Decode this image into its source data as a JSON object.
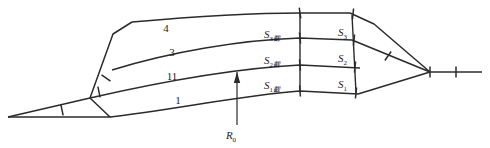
{
  "figure": {
    "type": "line-diagram",
    "background_color": "#ffffff",
    "stroke_color": "#2b2b2b"
  },
  "layer_labels": [
    {
      "id": "layer-4",
      "text": "4",
      "x": 166,
      "y": 32
    },
    {
      "id": "layer-3",
      "text": "3",
      "x": 172,
      "y": 56
    },
    {
      "id": "layer-11",
      "text": "11",
      "x": 172,
      "y": 80
    },
    {
      "id": "layer-1",
      "text": "1",
      "x": 178,
      "y": 104
    }
  ],
  "section_labels": [
    {
      "id": "s3-left",
      "base": "S",
      "sub": "3",
      "sub_extra": "截",
      "x": 264,
      "y": 38
    },
    {
      "id": "s2-left",
      "base": "S",
      "sub": "2",
      "sub_extra": "截",
      "x": 264,
      "y": 64
    },
    {
      "id": "s1-left",
      "base": "S",
      "sub": "1",
      "sub_extra": "截",
      "x": 264,
      "y": 89
    },
    {
      "id": "s3-right",
      "base": "S",
      "sub": "3",
      "sub_extra": "",
      "x": 338,
      "y": 36
    },
    {
      "id": "s2-right",
      "base": "S",
      "sub": "2",
      "sub_extra": "",
      "x": 338,
      "y": 62
    },
    {
      "id": "s1-right",
      "base": "S",
      "sub": "1",
      "sub_extra": "",
      "x": 338,
      "y": 88
    }
  ],
  "annotation": {
    "id": "radius-callout",
    "base": "R",
    "sub": "0",
    "x": 231,
    "y": 139,
    "arrow_from": {
      "x": 237,
      "y": 125
    },
    "arrow_to": {
      "x": 237,
      "y": 72
    }
  },
  "geometry": {
    "curves": [
      {
        "name": "boundary-4",
        "path": "M 132 22 C 200 16 260 13 300 13 L 350 13"
      },
      {
        "name": "boundary-3",
        "path": "M 112 70 C 170 52 240 40 300 38 L 352 40"
      },
      {
        "name": "boundary-11",
        "path": "M 90 98 C 160 82 240 68 300 65 L 360 68"
      },
      {
        "name": "boundary-1",
        "path": "M 110 117 C 170 110 245 95 300 91 L 358 94"
      }
    ],
    "edges": [
      {
        "name": "left-flank-upper",
        "path": "M 132 22 L 113 34 L 90 98"
      },
      {
        "name": "left-base-lower",
        "path": "M 90 98 L 110 117 L 8 117"
      },
      {
        "name": "left-base-upper",
        "path": "M 8 117 L 90 98"
      },
      {
        "name": "right-flank-upper",
        "path": "M 350 13 L 374 24 L 430 72"
      },
      {
        "name": "right-base-upper",
        "path": "M 352 40 L 430 72"
      },
      {
        "name": "right-base-lower",
        "path": "M 358 94 L 430 72"
      },
      {
        "name": "right-tail",
        "path": "M 430 72 L 482 72"
      }
    ],
    "grid_lines": [
      {
        "name": "cross-section-left",
        "path": "M 300 13 L 300 91"
      },
      {
        "name": "cross-section-right",
        "path": "M 352 15 L 356 93"
      }
    ],
    "ticks": [
      {
        "name": "tick-base-left",
        "x": 62,
        "y": 110,
        "angle": -12
      },
      {
        "name": "tick-flank-left",
        "x": 99,
        "y": 92,
        "angle": -12
      },
      {
        "name": "tick-mid-left",
        "x": 106,
        "y": 78,
        "angle": -55
      },
      {
        "name": "tick-grid-a1",
        "x": 300,
        "y": 13,
        "angle": -8
      },
      {
        "name": "tick-grid-a2",
        "x": 300,
        "y": 38,
        "angle": -6
      },
      {
        "name": "tick-grid-a3",
        "x": 300,
        "y": 65,
        "angle": -5
      },
      {
        "name": "tick-grid-a4",
        "x": 300,
        "y": 91,
        "angle": -4
      },
      {
        "name": "tick-grid-b1",
        "x": 353,
        "y": 14,
        "angle": 6
      },
      {
        "name": "tick-grid-b2",
        "x": 354,
        "y": 40,
        "angle": 6
      },
      {
        "name": "tick-grid-b3",
        "x": 355,
        "y": 67,
        "angle": 6
      },
      {
        "name": "tick-grid-b4",
        "x": 356,
        "y": 93,
        "angle": 6
      },
      {
        "name": "tick-right-a",
        "x": 388,
        "y": 56,
        "angle": 35
      },
      {
        "name": "tick-right-b",
        "x": 430,
        "y": 72,
        "angle": 0
      },
      {
        "name": "tick-right-c",
        "x": 456,
        "y": 72,
        "angle": 0
      }
    ]
  }
}
